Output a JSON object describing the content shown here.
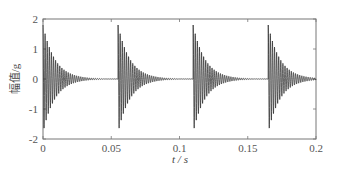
{
  "chart_data": {
    "type": "line",
    "title": "",
    "xlabel": "t / s",
    "ylabel": "幅值/g",
    "xlim": [
      0,
      0.2
    ],
    "ylim": [
      -2,
      2
    ],
    "xticks": [
      0,
      0.05,
      0.1,
      0.15,
      0.2
    ],
    "xtick_labels": [
      "0",
      "0.05",
      "0.1",
      "0.15",
      "0.2"
    ],
    "yticks": [
      -2,
      -1,
      0,
      1,
      2
    ],
    "ytick_labels": [
      "-2",
      "-1",
      "0",
      "1",
      "2"
    ],
    "grid": false,
    "legend": null,
    "series": [
      {
        "name": "acceleration",
        "description": "periodic decaying oscillation impulses",
        "impulse_times": [
          0.0,
          0.055,
          0.11,
          0.165
        ],
        "peak_amplitude": 1.8,
        "min_amplitude": -1.6,
        "decay_duration_s": 0.035,
        "oscillation_frequency_hz": 650,
        "color": "#222222"
      }
    ]
  }
}
